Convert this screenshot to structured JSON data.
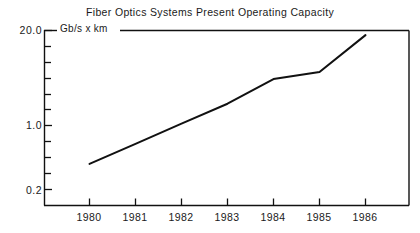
{
  "chart_data": {
    "type": "line",
    "title": "Fiber Optics Systems Present Operating Capacity",
    "xlabel": "",
    "ylabel": "Gb/s x km",
    "yscale": "log",
    "ylim": [
      0.2,
      20.0
    ],
    "ytick_labels": [
      "20.0",
      "1.0",
      "0.2"
    ],
    "ytick_values": [
      20.0,
      1.0,
      0.2
    ],
    "categories": [
      "1980",
      "1981",
      "1982",
      "1983",
      "1984",
      "1985",
      "1986"
    ],
    "x": [
      1980,
      1981,
      1982,
      1983,
      1984,
      1985,
      1986
    ],
    "values": [
      0.42,
      0.75,
      1.35,
      2.4,
      4.9,
      6.0,
      17.5
    ],
    "series": [
      {
        "name": "Present Operating Capacity",
        "values": [
          0.42,
          0.75,
          1.35,
          2.4,
          4.9,
          6.0,
          17.5
        ]
      }
    ],
    "grid": false,
    "legend": "none",
    "line_color": "#111111"
  },
  "axes": {
    "unit_label": "Gb/s x km",
    "y_labels": [
      "20.0",
      "1.0",
      "0.2"
    ],
    "x_labels": [
      "1980",
      "1981",
      "1982",
      "1983",
      "1984",
      "1985",
      "1986"
    ]
  }
}
